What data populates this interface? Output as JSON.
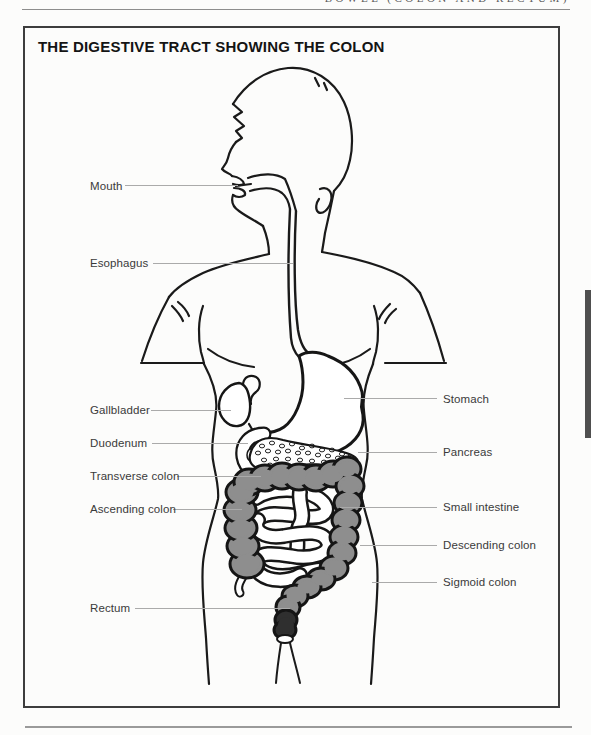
{
  "running_head": "BOWEL (COLON AND RECTUM)",
  "title": "THE DIGESTIVE TRACT SHOWING THE COLON",
  "labels": {
    "mouth": "Mouth",
    "esophagus": "Esophagus",
    "gallbladder": "Gallbladder",
    "duodenum": "Duodenum",
    "transverse_colon": "Transverse colon",
    "ascending_colon": "Ascending colon",
    "rectum": "Rectum",
    "stomach": "Stomach",
    "pancreas": "Pancreas",
    "small_intestine": "Small intestine",
    "descending_colon": "Descending colon",
    "sigmoid_colon": "Sigmoid colon"
  },
  "colors": {
    "outline": "#1a1a1a",
    "colon_fill": "#8e8e8e",
    "rectum_fill": "#2f2f2f",
    "leader_line": "#aaaaaa",
    "panel_border": "#3d3d3d"
  }
}
